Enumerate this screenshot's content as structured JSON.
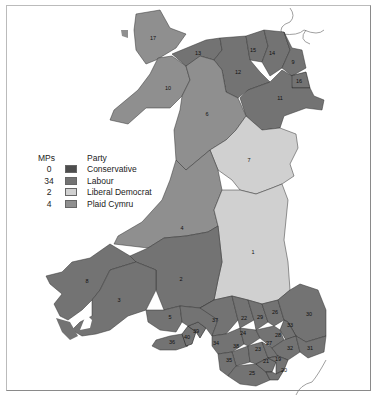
{
  "colors": {
    "conservative": "#4d4d4d",
    "labour": "#737373",
    "liberal_democrat": "#d0d0d0",
    "plaid_cymru": "#8f8f8f",
    "border": "#333333",
    "coast": "#777777"
  },
  "legend": {
    "header_mps": "MPs",
    "header_party": "Party",
    "rows": [
      {
        "mps": "0",
        "party": "Conservative",
        "color": "#4d4d4d"
      },
      {
        "mps": "34",
        "party": "Labour",
        "color": "#737373"
      },
      {
        "mps": "2",
        "party": "Liberal Democrat",
        "color": "#d0d0d0"
      },
      {
        "mps": "4",
        "party": "Plaid Cymru",
        "color": "#8f8f8f"
      }
    ]
  },
  "constituency_labels": {
    "c1": "1",
    "c2": "2",
    "c3": "3",
    "c4": "4",
    "c5": "5",
    "c6": "6",
    "c7": "7",
    "c8": "8",
    "c9": "9",
    "c10": "10",
    "c11": "11",
    "c12": "12",
    "c13": "13",
    "c14": "14",
    "c15": "15",
    "c16": "16",
    "c17": "17",
    "c20": "20",
    "c21": "21",
    "c22": "22",
    "c23": "23",
    "c24": "24",
    "c25": "25",
    "c26": "26",
    "c27": "27",
    "c28": "28",
    "c29": "29",
    "c30": "30",
    "c31": "31",
    "c32": "32",
    "c33": "33",
    "c34": "34",
    "c35": "35",
    "c36": "36",
    "c37": "37",
    "c38": "38",
    "c39": "39",
    "c40": "40",
    "c19": "19"
  }
}
